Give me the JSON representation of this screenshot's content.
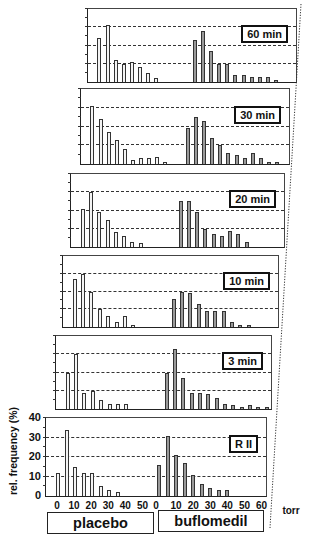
{
  "chart_data": {
    "type": "bar",
    "title": "",
    "ylabel": "rel. frequency (%)",
    "xlabel": "torr",
    "ylim": [
      0,
      40
    ],
    "yticks": [
      0,
      10,
      20,
      30,
      40
    ],
    "grid": "dashed horizontal at 10, 20, 30",
    "groups": [
      "placebo",
      "buflomedil"
    ],
    "x_ticks": {
      "placebo": [
        0,
        10,
        20,
        30,
        40,
        50
      ],
      "buflomedil": [
        0,
        10,
        20,
        30,
        40,
        50,
        60
      ]
    },
    "bin_width_torr": 5,
    "panels": [
      {
        "label": "60 min",
        "placebo": [
          24,
          31,
          12,
          10,
          11,
          8,
          5,
          2
        ],
        "buflomedil": [
          23,
          28,
          17,
          10,
          10,
          4,
          4,
          3,
          3,
          3,
          1
        ]
      },
      {
        "label": "30 min",
        "placebo": [
          31,
          24,
          17,
          13,
          8,
          2,
          3,
          3,
          4,
          1
        ],
        "buflomedil": [
          19,
          25,
          23,
          14,
          10,
          6,
          5,
          3,
          6,
          3,
          1,
          1
        ]
      },
      {
        "label": "20 min",
        "placebo": [
          21,
          30,
          19,
          15,
          8,
          6,
          3,
          2
        ],
        "buflomedil": [
          25,
          25,
          19,
          10,
          7,
          6,
          9,
          7,
          3
        ]
      },
      {
        "label": "10 min",
        "placebo": [
          27,
          30,
          20,
          10,
          6,
          3,
          6,
          1
        ],
        "buflomedil": [
          16,
          20,
          19,
          13,
          9,
          9,
          9,
          3,
          1,
          1
        ]
      },
      {
        "label": "3 min",
        "placebo": [
          20,
          30,
          9,
          10,
          5,
          3,
          3,
          3
        ],
        "buflomedil": [
          20,
          33,
          17,
          9,
          9,
          8,
          6,
          3,
          2,
          1,
          2,
          1,
          1
        ]
      },
      {
        "label": "R II",
        "placebo": [
          12,
          34,
          15,
          12,
          12,
          5,
          3,
          2
        ],
        "buflomedil": [
          16,
          31,
          21,
          17,
          11,
          6,
          4,
          3,
          3
        ]
      }
    ]
  },
  "axis": {
    "y_title": "rel. frequency (%)",
    "y_ticks": [
      "0",
      "10",
      "20",
      "30",
      "40"
    ],
    "unit": "torr",
    "placebo_ticks": [
      "0",
      "10",
      "20",
      "30",
      "40",
      "50"
    ],
    "buflomedil_ticks": [
      "0",
      "10",
      "20",
      "30",
      "40",
      "50",
      "60"
    ]
  },
  "groups": {
    "placebo": "placebo",
    "buflomedil": "buflomedil"
  },
  "colors": {
    "placebo_bar": "#f4f4f4",
    "buflomedil_bar": "#9a9a9a",
    "frame": "#222222"
  }
}
